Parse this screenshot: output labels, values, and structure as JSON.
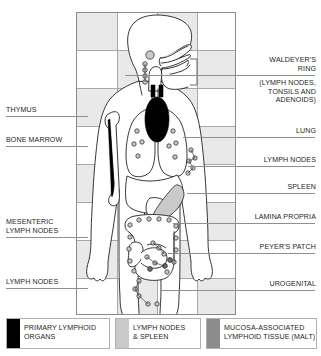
{
  "diagram": {
    "grid": {
      "columns": 4,
      "rows": 8,
      "line_color": "#a8a8a8",
      "tile_color": "#e9e9e9"
    },
    "outline_color": "#231f20",
    "colors": {
      "primary_lymphoid": "#000000",
      "lymph_nodes_spleen": "#c9c9c9",
      "malt": "#8c8c8c",
      "background": "#ffffff"
    }
  },
  "labels_left": [
    {
      "id": "thymus",
      "text": "THYMUS",
      "name": "label-thymus"
    },
    {
      "id": "bone-marrow",
      "text": "BONE MARROW",
      "name": "label-bone-marrow"
    },
    {
      "id": "mesenteric",
      "text": "MESENTERIC\nLYMPH NODES",
      "name": "label-mesenteric-lymph-nodes"
    },
    {
      "id": "lymph-nodes",
      "text": "LYMPH NODES",
      "name": "label-lymph-nodes-left"
    }
  ],
  "labels_right": [
    {
      "id": "waldeyer",
      "text": "WALDEYER'S\nRING",
      "name": "label-waldeyers-ring"
    },
    {
      "id": "waldeyer-sub",
      "text": "(LYMPH NODES,\nTONSILS AND\nADENOIDS)",
      "name": "label-waldeyers-ring-detail"
    },
    {
      "id": "lung",
      "text": "LUNG",
      "name": "label-lung"
    },
    {
      "id": "lymph-nodes-r",
      "text": "LYMPH NODES",
      "name": "label-lymph-nodes-right"
    },
    {
      "id": "spleen",
      "text": "SPLEEN",
      "name": "label-spleen"
    },
    {
      "id": "lamina",
      "text": "LAMINA PROPRIA",
      "name": "label-lamina-propria"
    },
    {
      "id": "peyer",
      "text": "PEYER'S PATCH",
      "name": "label-peyers-patch"
    },
    {
      "id": "urogenital",
      "text": "UROGENITAL",
      "name": "label-urogenital"
    }
  ],
  "legend": [
    {
      "id": "primary",
      "swatch": "#000000",
      "text": "PRIMARY LYMPHOID\nORGANS",
      "name": "legend-primary-lymphoid-organs"
    },
    {
      "id": "nodes",
      "swatch": "#c9c9c9",
      "text": "LYMPH NODES\n& SPLEEN",
      "name": "legend-lymph-nodes-and-spleen"
    },
    {
      "id": "malt",
      "swatch": "#8c8c8c",
      "text": "MUCOSA-ASSOCIATED\nLYMPHOID TISSUE (MALT)",
      "name": "legend-malt"
    }
  ]
}
